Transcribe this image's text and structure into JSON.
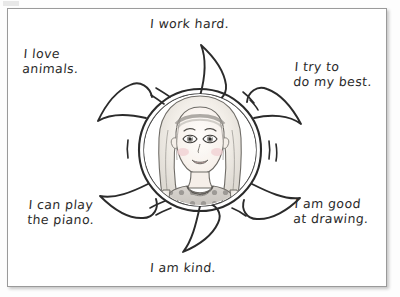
{
  "worksheet": {
    "title": "Self-affirmation flower worksheet",
    "frame_color": "#9a9a9a",
    "ink_color": "#2b2b2b",
    "background_color": "#ffffff"
  },
  "illustration": {
    "name": "girl-portrait-in-sun-petals",
    "subject": "smiling girl with blonde hair, headband and polka-dot top",
    "hair_color": "#e8e3da",
    "skin_color": "#fbf6f2",
    "cheek_color": "#f0cfd2",
    "shirt_color": "#cfcbc6",
    "shirt_dot_color": "#8d8a86",
    "petal_count": 6
  },
  "captions": {
    "top": "I work hard.",
    "upper_left": "I love\nanimals.",
    "upper_right": "I try to\ndo my best.",
    "lower_left": "I can play\nthe piano.",
    "lower_right": "I am good\nat drawing.",
    "bottom": "I am kind."
  }
}
